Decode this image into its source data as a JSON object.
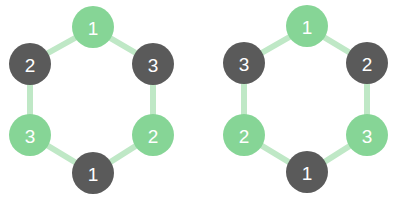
{
  "colors": {
    "ring": "#bfe8c6",
    "green_node": "#86d596",
    "dark_node": "#5a5a5a",
    "label": "#ffffff",
    "background": "#ffffff"
  },
  "diagrams": [
    {
      "name": "left-ring",
      "nodes": [
        {
          "position": "top",
          "label": "1",
          "color": "green"
        },
        {
          "position": "upper-right",
          "label": "3",
          "color": "dark"
        },
        {
          "position": "lower-right",
          "label": "2",
          "color": "green"
        },
        {
          "position": "bottom",
          "label": "1",
          "color": "dark"
        },
        {
          "position": "lower-left",
          "label": "3",
          "color": "green"
        },
        {
          "position": "upper-left",
          "label": "2",
          "color": "dark"
        }
      ]
    },
    {
      "name": "right-ring",
      "nodes": [
        {
          "position": "top",
          "label": "1",
          "color": "green"
        },
        {
          "position": "upper-right",
          "label": "2",
          "color": "dark"
        },
        {
          "position": "lower-right",
          "label": "3",
          "color": "green"
        },
        {
          "position": "bottom",
          "label": "1",
          "color": "dark"
        },
        {
          "position": "lower-left",
          "label": "2",
          "color": "green"
        },
        {
          "position": "upper-left",
          "label": "3",
          "color": "dark"
        }
      ]
    }
  ]
}
